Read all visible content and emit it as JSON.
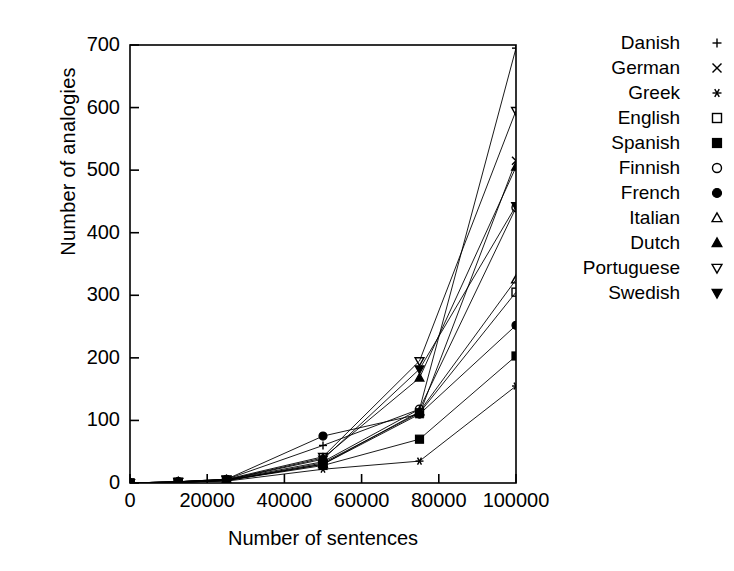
{
  "chart_data": {
    "type": "line",
    "title": "",
    "xlabel": "Number of sentences",
    "ylabel": "Number of analogies",
    "xlim": [
      0,
      100000
    ],
    "ylim": [
      0,
      700
    ],
    "xticks": [
      0,
      20000,
      40000,
      60000,
      80000,
      100000
    ],
    "xticklabels": [
      "0",
      "20000",
      "40000",
      "60000",
      "80000",
      "100000"
    ],
    "yticks": [
      0,
      100,
      200,
      300,
      400,
      500,
      600,
      700
    ],
    "yticklabels": [
      "0",
      "100",
      "200",
      "300",
      "400",
      "500",
      "600",
      "700"
    ],
    "grid": false,
    "legend_position": "right",
    "x": [
      0,
      12500,
      25000,
      50000,
      75000,
      100000
    ],
    "series": [
      {
        "name": "Danish",
        "marker": "plus",
        "values": [
          0,
          2,
          6,
          60,
          118,
          695
        ]
      },
      {
        "name": "German",
        "marker": "cross",
        "values": [
          0,
          1,
          4,
          30,
          110,
          515
        ]
      },
      {
        "name": "Greek",
        "marker": "asterisk",
        "values": [
          0,
          1,
          3,
          22,
          35,
          155
        ]
      },
      {
        "name": "English",
        "marker": "open-square",
        "values": [
          0,
          1,
          4,
          32,
          112,
          305
        ]
      },
      {
        "name": "Spanish",
        "marker": "filled-square",
        "values": [
          0,
          1,
          4,
          28,
          70,
          203
        ]
      },
      {
        "name": "Finnish",
        "marker": "open-circle",
        "values": [
          0,
          2,
          5,
          34,
          118,
          440
        ]
      },
      {
        "name": "French",
        "marker": "filled-circle",
        "values": [
          0,
          2,
          6,
          75,
          110,
          252
        ]
      },
      {
        "name": "Italian",
        "marker": "open-triangle-up",
        "values": [
          0,
          1,
          4,
          30,
          114,
          325
        ]
      },
      {
        "name": "Dutch",
        "marker": "filled-triangle-up",
        "values": [
          0,
          2,
          5,
          40,
          168,
          505
        ]
      },
      {
        "name": "Portuguese",
        "marker": "open-triangle-down",
        "values": [
          0,
          2,
          6,
          42,
          195,
          595
        ]
      },
      {
        "name": "Swedish",
        "marker": "filled-triangle-down",
        "values": [
          0,
          2,
          5,
          38,
          182,
          443
        ]
      }
    ]
  },
  "legend": {
    "entries": [
      {
        "label": "Danish"
      },
      {
        "label": "German"
      },
      {
        "label": "Greek"
      },
      {
        "label": "English"
      },
      {
        "label": "Spanish"
      },
      {
        "label": "Finnish"
      },
      {
        "label": "French"
      },
      {
        "label": "Italian"
      },
      {
        "label": "Dutch"
      },
      {
        "label": "Portuguese"
      },
      {
        "label": "Swedish"
      }
    ]
  },
  "colors": {
    "line": "#000000",
    "axis": "#000000",
    "background": "#ffffff"
  }
}
